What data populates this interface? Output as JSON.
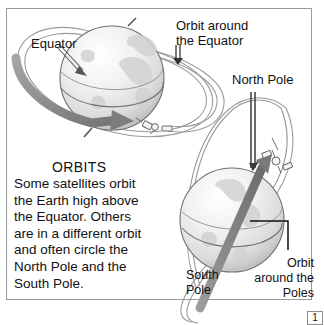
{
  "figure": {
    "title": "ORBITS",
    "body_lines": [
      "Some satellites orbit",
      "the Earth high above",
      "the Equator. Others",
      "are in a different orbit",
      "and often circle the",
      "North Pole and the",
      "South Pole."
    ],
    "body_text": "Some satellites orbit the Earth high above the Equator. Others are in a different orbit and often circle the North Pole and the South Pole.",
    "page_number": "1"
  },
  "labels": {
    "equator": "Equator",
    "orbit_around_equator_line1": "Orbit around",
    "orbit_around_equator_line2": "the Equator",
    "north_pole": "North Pole",
    "south_pole_line1": "South",
    "south_pole_line2": "Pole",
    "orbit_around_poles_line1": "Orbit",
    "orbit_around_poles_line2": "around the",
    "orbit_around_poles_line3": "Poles"
  },
  "colors": {
    "frame_border": "#9a9a9a",
    "text": "#111111",
    "globe_light": "#fbfbfb",
    "globe_mid": "#e3e3e3",
    "globe_shadow": "#bdbdbd",
    "globe_outline": "#6f6f6f",
    "orbit_line": "#9b9b9b",
    "arrow_gray": "#8a8a8a",
    "arrow_dark": "#6a6a6a",
    "axis_dark": "#3a3a3a",
    "satellite_body": "#f2f2f2",
    "page_box_border": "#8c8c8c"
  },
  "icons": {
    "globe_top": "globe-icon",
    "globe_bottom": "globe-icon",
    "satellite_equatorial": "satellite-icon",
    "satellite_polar": "satellite-icon",
    "equator_pointer": "arrow-pointer-icon",
    "rotation_arrow": "curved-arrow-icon",
    "polar_orbit_arrow": "straight-arrow-icon",
    "equator_orbit_pointer": "down-arrow-icon",
    "north_pole_pointer": "down-arrow-icon"
  }
}
